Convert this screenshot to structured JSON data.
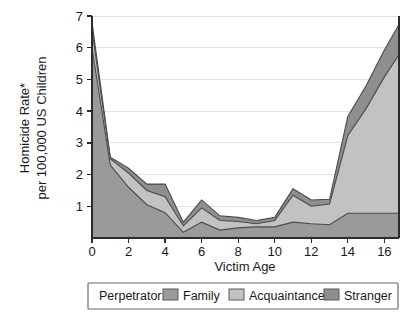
{
  "chart_data": {
    "type": "area",
    "stacked": true,
    "title": "",
    "xlabel": "Victim Age",
    "ylabel": "Homicide Rate*\nper 100,000 US Children",
    "ylabel_line1": "Homicide Rate*",
    "ylabel_line2": "per 100,000 US Children",
    "x": [
      0,
      1,
      2,
      3,
      4,
      5,
      6,
      7,
      8,
      9,
      10,
      11,
      12,
      13,
      14,
      15,
      16,
      16.8
    ],
    "xlim": [
      0,
      16.8
    ],
    "ylim": [
      0,
      7
    ],
    "xticks": [
      0,
      2,
      4,
      6,
      8,
      10,
      12,
      14,
      16
    ],
    "yticks": [
      1,
      2,
      3,
      4,
      5,
      6,
      7
    ],
    "xtick_labels": [
      "0",
      "2",
      "4",
      "6",
      "8",
      "10",
      "12",
      "14",
      "16"
    ],
    "ytick_labels": [
      "1",
      "2",
      "3",
      "4",
      "5",
      "6",
      "7"
    ],
    "grid": true,
    "grid_axis": "y",
    "legend_position": "bottom",
    "legend_title": "Perpetrator:",
    "series": [
      {
        "name": "Family",
        "color": "#9a9a9a",
        "values": [
          6.0,
          2.3,
          1.6,
          1.05,
          0.8,
          0.18,
          0.5,
          0.25,
          0.32,
          0.35,
          0.35,
          0.5,
          0.45,
          0.42,
          0.78,
          0.78,
          0.78,
          0.78
        ]
      },
      {
        "name": "Acquaintance",
        "color": "#c2c2c2",
        "values": [
          0.55,
          0.2,
          0.45,
          0.45,
          0.5,
          0.2,
          0.45,
          0.3,
          0.2,
          0.1,
          0.2,
          0.85,
          0.55,
          0.65,
          2.45,
          3.3,
          4.3,
          5.0
        ]
      },
      {
        "name": "Stranger",
        "color": "#8f8f8f",
        "values": [
          0.25,
          0.05,
          0.15,
          0.2,
          0.4,
          0.12,
          0.25,
          0.15,
          0.13,
          0.1,
          0.1,
          0.2,
          0.2,
          0.15,
          0.6,
          0.72,
          0.85,
          0.95
        ]
      }
    ],
    "footnote": "*"
  },
  "legend": {
    "title": "Perpetrator:",
    "entries": [
      {
        "label": "Family",
        "color": "#9a9a9a"
      },
      {
        "label": "Acquaintance",
        "color": "#c2c2c2"
      },
      {
        "label": "Stranger",
        "color": "#8f8f8f"
      }
    ]
  }
}
